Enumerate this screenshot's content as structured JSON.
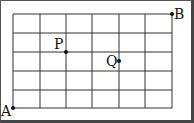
{
  "diagram": {
    "type": "grid-points",
    "grid": {
      "columns": 6,
      "rows": 5
    },
    "points": [
      {
        "label": "A",
        "col": 0,
        "row": 0
      },
      {
        "label": "B",
        "col": 6,
        "row": 5
      },
      {
        "label": "P",
        "col": 2,
        "row": 3
      },
      {
        "label": "Q",
        "col": 4,
        "row": 2.5
      }
    ],
    "colors": {
      "grid": "#333333",
      "border": "#444444",
      "point": "#111111"
    }
  },
  "labels": {
    "a": "A",
    "b": "B",
    "p": "P",
    "q": "Q"
  }
}
